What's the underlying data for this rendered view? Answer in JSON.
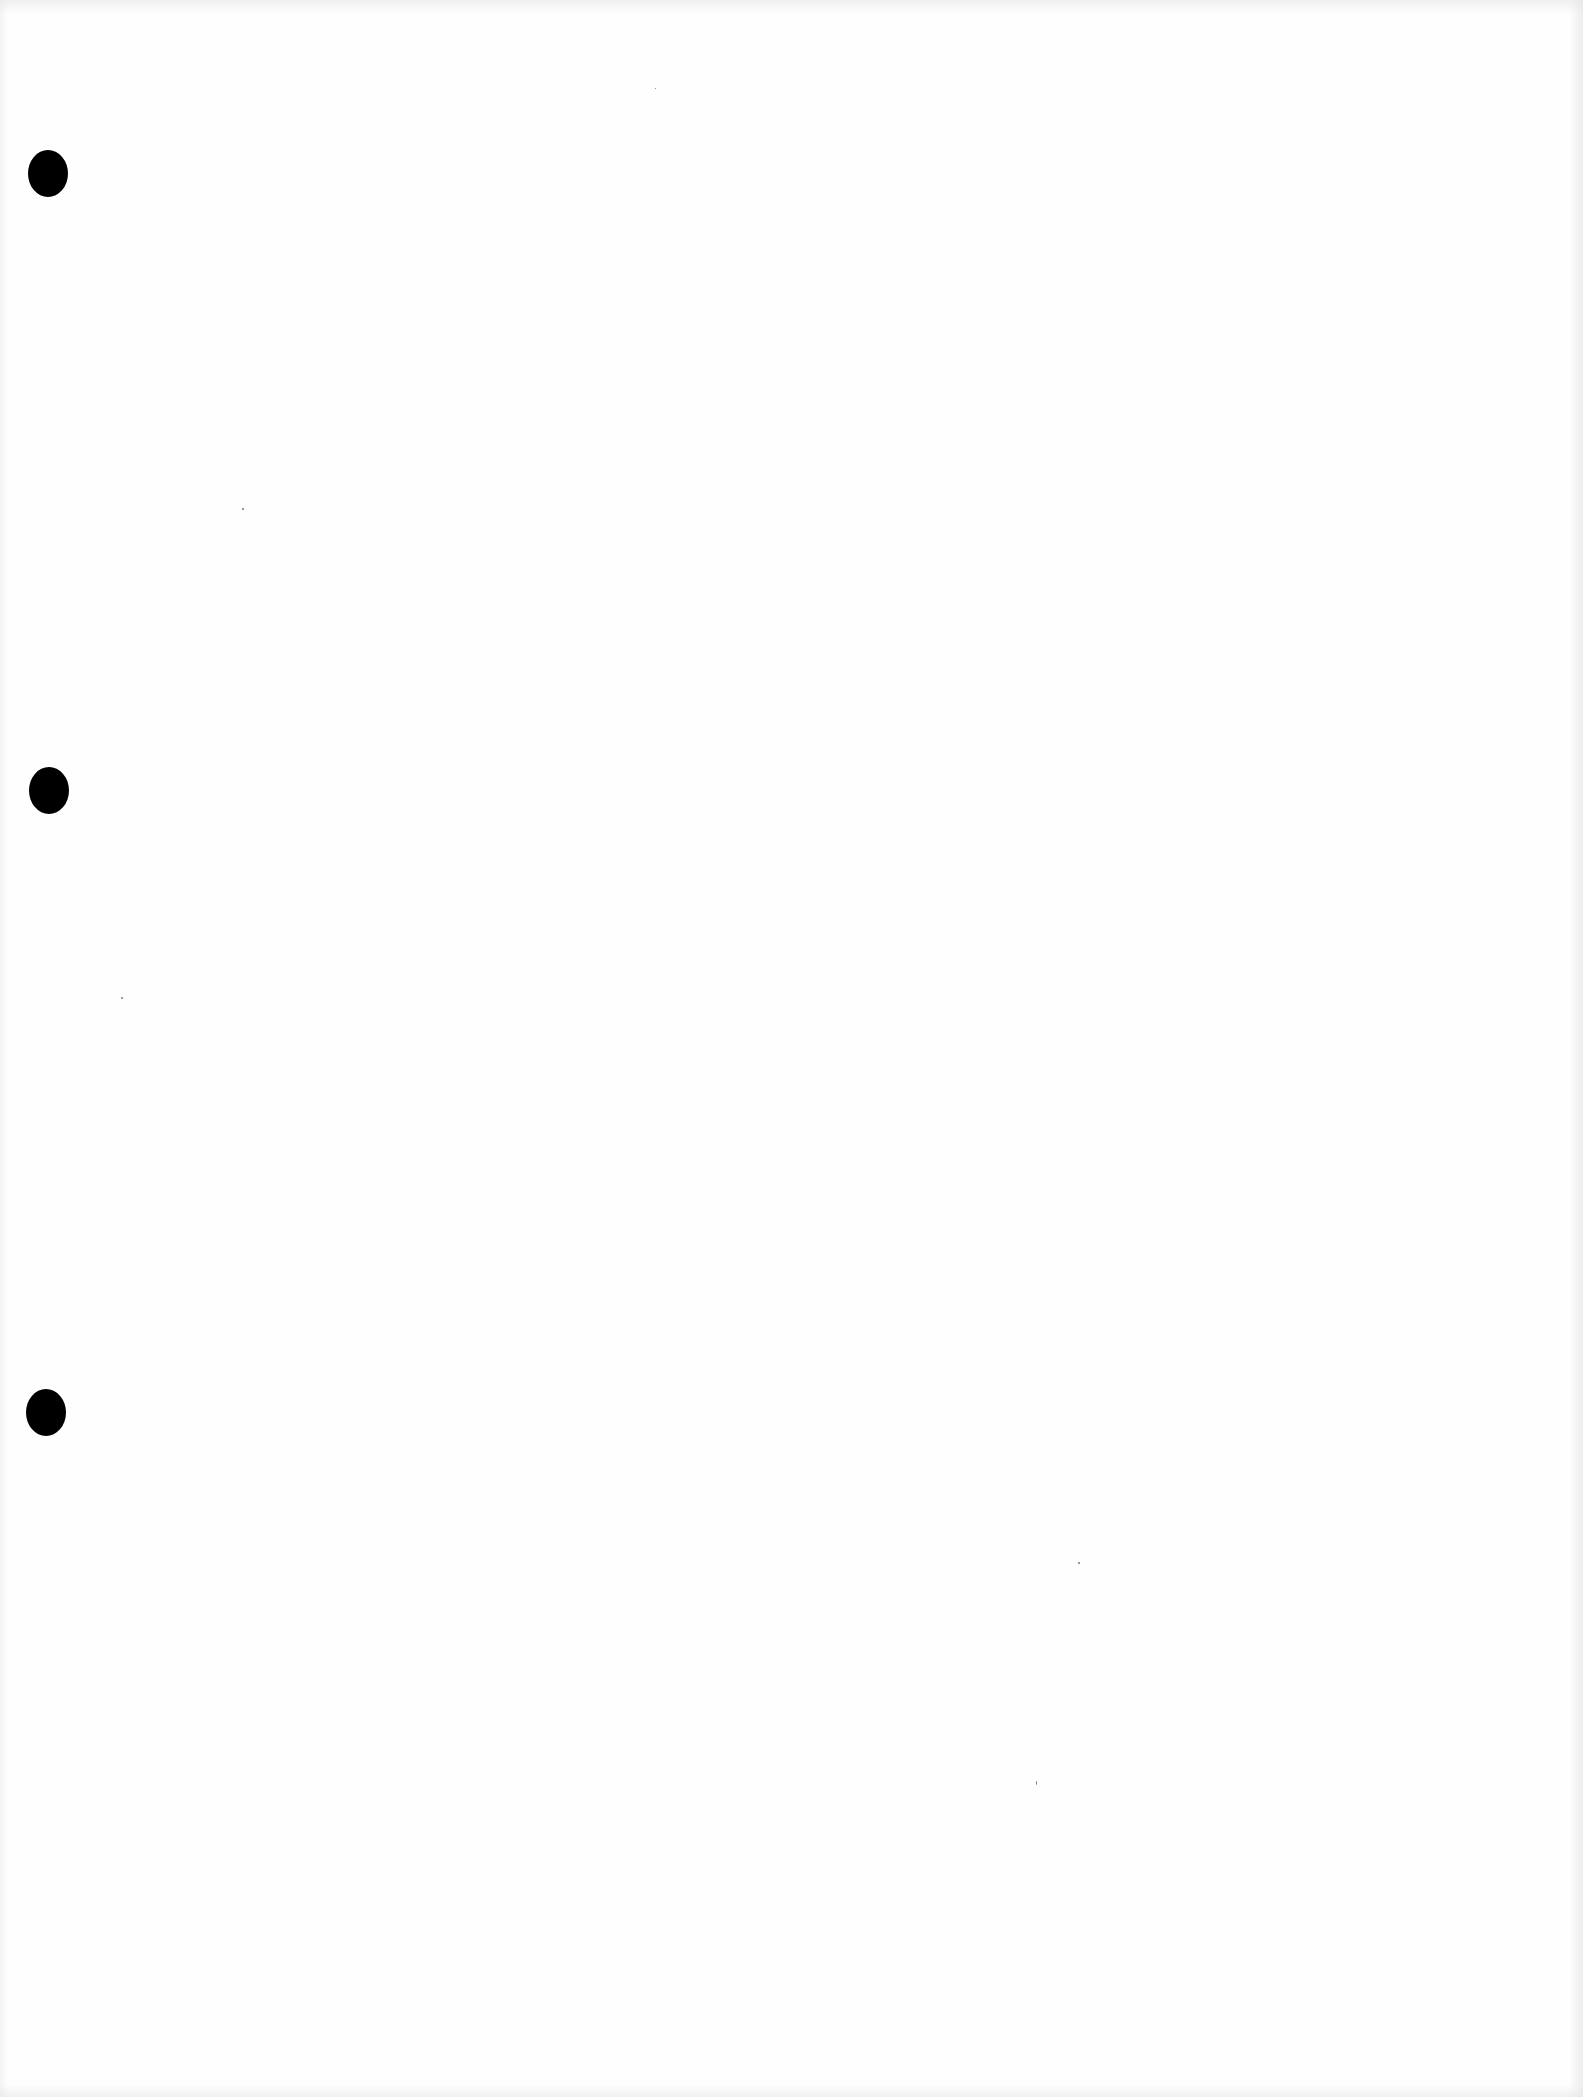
{
  "document": {
    "type": "blank scanned page",
    "text": "",
    "paper_color": "#fefefe"
  },
  "punch_holes": [
    {
      "label": "top",
      "x": 28,
      "y": 150,
      "color": "#000000"
    },
    {
      "label": "middle",
      "x": 29,
      "y": 767,
      "color": "#000000"
    },
    {
      "label": "bottom",
      "x": 26,
      "y": 1389,
      "color": "#000000"
    }
  ]
}
